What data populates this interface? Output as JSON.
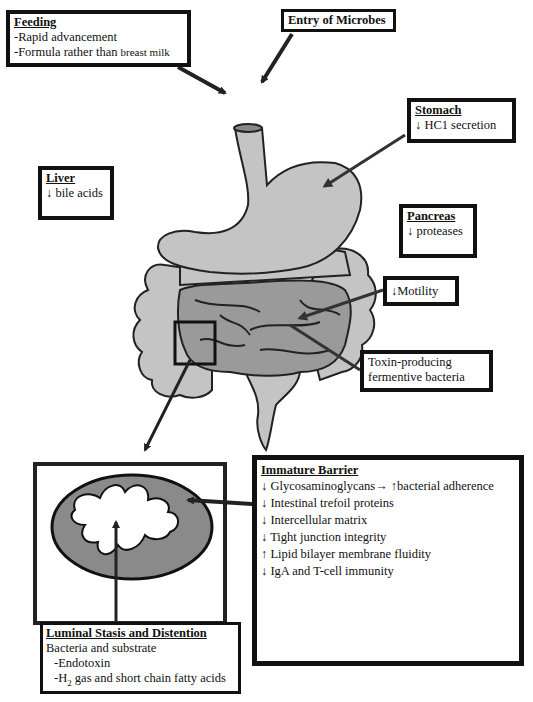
{
  "feeding": {
    "title": "Feeding",
    "items": [
      "-Rapid advancement",
      "-Formula rather than ",
      "breast milk"
    ]
  },
  "entry": {
    "title": "Entry of Microbes"
  },
  "stomach": {
    "title": "Stomach",
    "items": [
      "↓ HC1  secretion"
    ]
  },
  "liver": {
    "title": "Liver",
    "items": [
      "↓ bile acids"
    ]
  },
  "pancreas": {
    "title": "Pancreas",
    "items": [
      "↓ proteases"
    ]
  },
  "motility": {
    "label": "↓Motility"
  },
  "toxin": {
    "items": [
      "Toxin-producing",
      "fermentive bacteria"
    ]
  },
  "barrier": {
    "title": "Immature Barrier",
    "items": [
      "↓ Glycosaminoglycans→ ↑bacterial adherence",
      "↓ Intestinal trefoil proteins",
      "↓ Intercellular matrix",
      "↓ Tight junction integrity",
      "↑ Lipid bilayer membrane fluidity",
      "↓ IgA and T-cell immunity"
    ]
  },
  "luminal": {
    "title": "Luminal Stasis and Distention",
    "line1": "Bacteria and substrate",
    "line2": "-Endotoxin",
    "line3_prefix": "-H",
    "line3_sub": "2",
    "line3_suffix": " gas and short chain fatty acids"
  },
  "colors": {
    "organ_fill": "#c4c4c4",
    "small_intestine_fill": "#9a9a9a",
    "outline": "#222222",
    "wall_fill": "#8a8a8a"
  }
}
